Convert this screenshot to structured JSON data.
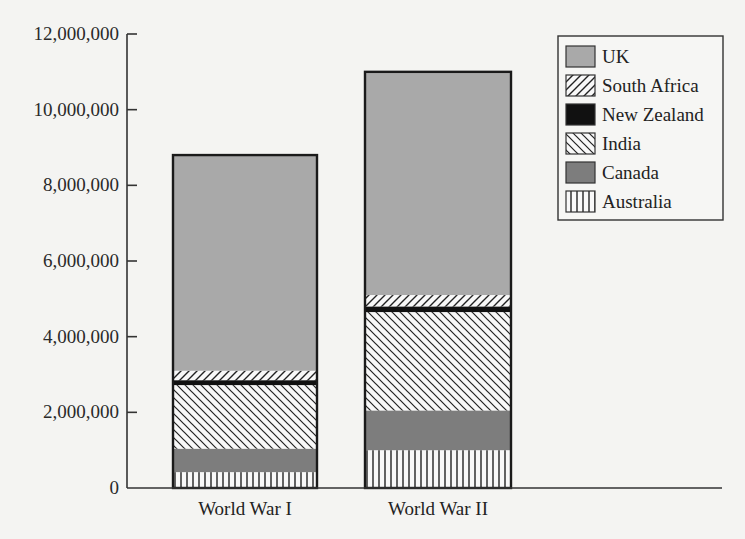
{
  "chart_data": {
    "type": "bar",
    "stacked": true,
    "title": "",
    "xlabel": "",
    "ylabel": "",
    "ylim": [
      0,
      12000000
    ],
    "yticks": [
      0,
      2000000,
      4000000,
      6000000,
      8000000,
      10000000,
      12000000
    ],
    "ytick_labels": [
      "0",
      "2,000,000",
      "4,000,000",
      "6,000,000",
      "8,000,000",
      "10,000,000",
      "12,000,000"
    ],
    "categories": [
      "World War I",
      "World War II"
    ],
    "series": [
      {
        "name": "Australia",
        "pattern": "vertical-lines",
        "values": [
          420000,
          1000000
        ]
      },
      {
        "name": "Canada",
        "pattern": "dark-gray",
        "values": [
          620000,
          1050000
        ]
      },
      {
        "name": "India",
        "pattern": "diagonal-backslash",
        "values": [
          1680000,
          2600000
        ]
      },
      {
        "name": "New Zealand",
        "pattern": "solid-black",
        "values": [
          130000,
          150000
        ]
      },
      {
        "name": "South Africa",
        "pattern": "diagonal-slash",
        "values": [
          250000,
          300000
        ]
      },
      {
        "name": "UK",
        "pattern": "light-gray",
        "values": [
          5700000,
          5900000
        ]
      }
    ],
    "totals": [
      8800000,
      11000000
    ],
    "legend": {
      "position": "top-right",
      "entries": [
        "UK",
        "South Africa",
        "New Zealand",
        "India",
        "Canada",
        "Australia"
      ]
    },
    "grid": false
  },
  "colors": {
    "uk": "#a9a9a9",
    "canada": "#7d7d7d",
    "new_zealand": "#111111",
    "background": "#f4f4f2",
    "outline": "#1a1a1a"
  }
}
